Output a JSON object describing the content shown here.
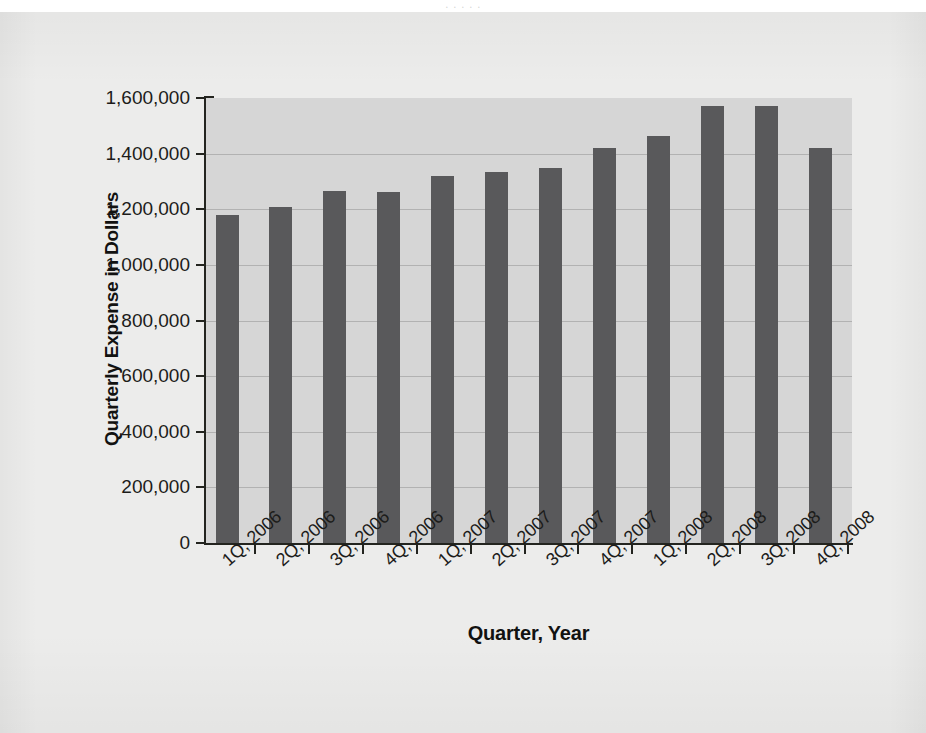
{
  "figure": {
    "background_color": "#ececeb",
    "plot_background_color": "#d6d6d6",
    "bar_color": "#59595b",
    "axis_color": "#23241f",
    "top_cropped_text": ". .                    .                           .                                                    ."
  },
  "chart_data": {
    "type": "bar",
    "title": "",
    "xlabel": "Quarter, Year",
    "ylabel": "Quarterly Expense in Dollars",
    "categories": [
      "1Q, 2006",
      "2Q, 2006",
      "3Q, 2006",
      "4Q, 2006",
      "1Q, 2007",
      "2Q, 2007",
      "3Q, 2007",
      "4Q, 2007",
      "1Q, 2008",
      "2Q, 2008",
      "3Q, 2008",
      "4Q, 2008"
    ],
    "values": [
      1180000,
      1210000,
      1265000,
      1262000,
      1318000,
      1333000,
      1350000,
      1422000,
      1462000,
      1572000,
      1570000,
      1420000
    ],
    "ylim": [
      0,
      1600000
    ],
    "ytick_values": [
      0,
      200000,
      400000,
      600000,
      800000,
      1000000,
      1200000,
      1400000,
      1600000
    ],
    "ytick_labels": [
      "0",
      "200,000",
      "400,000",
      "600,000",
      "800,000",
      "1,000,000",
      "1,200,000",
      "1,400,000",
      "1,600,000"
    ],
    "grid": true,
    "legend": "none",
    "series_name": "Quarterly Expense"
  }
}
